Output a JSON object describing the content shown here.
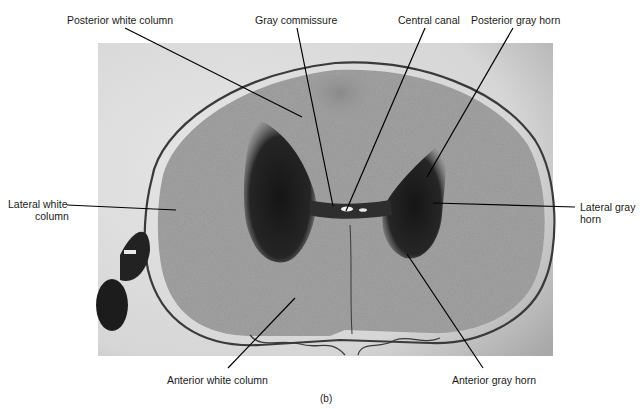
{
  "figure": {
    "caption": "(b)",
    "colors": {
      "background": "#ffffff",
      "photo_bg": "#d9d9d9",
      "white_matter": "#a9a9a9",
      "gray_matter": "#2a2a2a",
      "meninges": "#3a3a3a",
      "leader_line": "#000000"
    }
  },
  "labels": {
    "posterior_white_column": "Posterior white column",
    "gray_commissure": "Gray commissure",
    "central_canal": "Central canal",
    "posterior_gray_horn": "Posterior gray horn",
    "lateral_white_column_line1": "Lateral white",
    "lateral_white_column_line2": "column",
    "lateral_gray_horn_line1": "Lateral gray",
    "lateral_gray_horn_line2": "horn",
    "anterior_white_column": "Anterior white column",
    "anterior_gray_horn": "Anterior gray horn"
  }
}
